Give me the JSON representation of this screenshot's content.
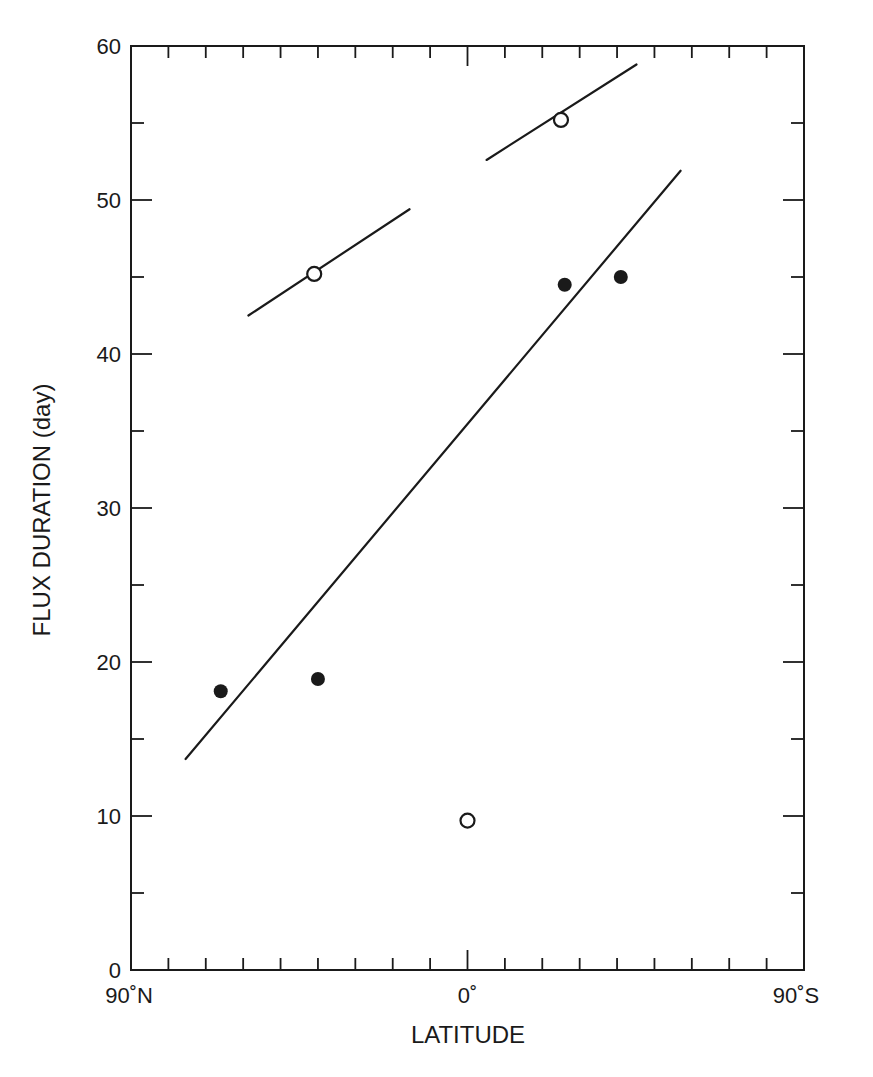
{
  "chart_data": {
    "type": "scatter",
    "title": "",
    "xlabel": "LATITUDE",
    "ylabel": "FLUX DURATION (day)",
    "xlim": [
      -90,
      90
    ],
    "ylim": [
      0,
      60
    ],
    "x_direction_note": "left = 90°N, right = 90°S; negative values = North, positive = South",
    "x_tick_labels": [
      {
        "value": -90,
        "label": "90˚N"
      },
      {
        "value": 0,
        "label": "0˚"
      },
      {
        "value": 90,
        "label": "90˚S"
      }
    ],
    "x_minor_ticks": [
      -80,
      -70,
      -60,
      -50,
      -40,
      -30,
      -20,
      -10,
      0,
      10,
      20,
      30,
      40,
      50,
      60,
      70,
      80
    ],
    "y_tick_labels": [
      0,
      10,
      20,
      30,
      40,
      50,
      60
    ],
    "y_minor_ticks": [
      5,
      15,
      25,
      35,
      45,
      55
    ],
    "grid": false,
    "legend": null,
    "series": [
      {
        "name": "filled-circles",
        "marker": "filled-circle",
        "points": [
          {
            "lat": -66,
            "value": 18.1
          },
          {
            "lat": -40,
            "value": 18.9
          },
          {
            "lat": 26,
            "value": 44.5
          },
          {
            "lat": 41,
            "value": 45.0
          }
        ]
      },
      {
        "name": "open-circles",
        "marker": "open-circle",
        "points": [
          {
            "lat": -41,
            "value": 45.2
          },
          {
            "lat": 25,
            "value": 55.2
          },
          {
            "lat": 0,
            "value": 9.7
          }
        ]
      }
    ],
    "lines": [
      {
        "name": "main-fit-line",
        "from": {
          "lat": -75.4,
          "value": 13.7
        },
        "to": {
          "lat": 57.0,
          "value": 51.9
        }
      },
      {
        "name": "upper-left-segment",
        "from": {
          "lat": -58.6,
          "value": 42.5
        },
        "to": {
          "lat": -15.5,
          "value": 49.4
        }
      },
      {
        "name": "upper-right-segment",
        "from": {
          "lat": 5.1,
          "value": 52.6
        },
        "to": {
          "lat": 45.2,
          "value": 58.8
        }
      }
    ]
  },
  "layout": {
    "plot": {
      "left": 131,
      "top": 46,
      "right": 804,
      "bottom": 970
    }
  },
  "colors": {
    "ink": "#1a1a1a",
    "background": "#ffffff"
  }
}
